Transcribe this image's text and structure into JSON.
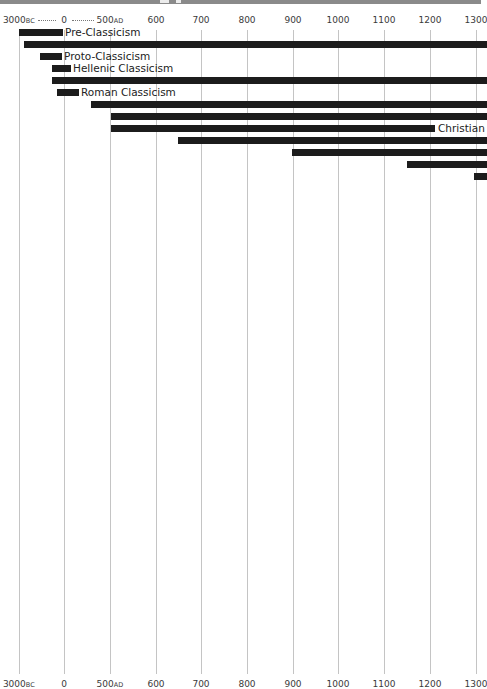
{
  "chart_data": {
    "type": "bar",
    "subtype": "timeline-gantt",
    "title": "",
    "axis": {
      "ticks": [
        {
          "label": "3000",
          "suffix": "BC",
          "x": 19
        },
        {
          "label": "0",
          "suffix": "",
          "x": 64
        },
        {
          "label": "500",
          "suffix": "AD",
          "x": 110
        },
        {
          "label": "600",
          "suffix": "",
          "x": 156
        },
        {
          "label": "700",
          "suffix": "",
          "x": 201
        },
        {
          "label": "800",
          "suffix": "",
          "x": 247
        },
        {
          "label": "900",
          "suffix": "",
          "x": 293
        },
        {
          "label": "1000",
          "suffix": "",
          "x": 338
        },
        {
          "label": "1100",
          "suffix": "",
          "x": 384
        },
        {
          "label": "1200",
          "suffix": "",
          "x": 430
        },
        {
          "label": "1300",
          "suffix": "",
          "x": 476
        }
      ],
      "top_separator": "dotted between 3000BC, 0 and 500AD",
      "grid": true
    },
    "bars": [
      {
        "label": "Pre-Classicism",
        "start_x": 19,
        "end_x": 57,
        "y": 29,
        "approx_start": "3000BC",
        "approx_end": "c. -1000"
      },
      {
        "label": "",
        "start_x": 24,
        "end_x": 481,
        "y": 41,
        "approx_start": "c. -2700",
        "approx_end": ">1300"
      },
      {
        "label": "Proto-Classicism",
        "start_x": 40,
        "end_x": 56,
        "y": 53,
        "approx_start": "c. -1600",
        "approx_end": "c. -700"
      },
      {
        "label": "Hellenic Classicism",
        "start_x": 52,
        "end_x": 65,
        "y": 65,
        "approx_start": "c. -800",
        "approx_end": "c. 0"
      },
      {
        "label": "",
        "start_x": 52,
        "end_x": 481,
        "y": 77,
        "approx_start": "c. -800",
        "approx_end": ">1300"
      },
      {
        "label": "Roman Classicism",
        "start_x": 57,
        "end_x": 73,
        "y": 89,
        "approx_start": "c. -500",
        "approx_end": "c. 100"
      },
      {
        "label": "",
        "start_x": 91,
        "end_x": 481,
        "y": 101,
        "approx_start": "c. 300",
        "approx_end": ">1300"
      },
      {
        "label": "",
        "start_x": 111,
        "end_x": 481,
        "y": 113,
        "approx_start": 500,
        "approx_end": ">1300"
      },
      {
        "label": "Christian",
        "start_x": 111,
        "end_x": 429,
        "y": 125,
        "approx_start": 500,
        "approx_end": 1200
      },
      {
        "label": "",
        "start_x": 178,
        "end_x": 481,
        "y": 137,
        "approx_start": 650,
        "approx_end": ">1300"
      },
      {
        "label": "",
        "start_x": 292,
        "end_x": 481,
        "y": 149,
        "approx_start": 900,
        "approx_end": ">1300"
      },
      {
        "label": "",
        "start_x": 407,
        "end_x": 481,
        "y": 161,
        "approx_start": 1150,
        "approx_end": ">1300"
      },
      {
        "label": "",
        "start_x": 474,
        "end_x": 481,
        "y": 173,
        "approx_start": 1295,
        "approx_end": ">1300"
      }
    ],
    "colors": {
      "bar": "#1c1c1c",
      "grid": "#c4c4c4",
      "text": "#3a3a3a",
      "top_band": "#8a8a8a"
    }
  },
  "labels": {
    "pre": "Pre-Classicism",
    "proto": "Proto-Classicism",
    "hellenic": "Hellenic Classicism",
    "roman": "Roman Classicism",
    "christian": "Christian"
  }
}
